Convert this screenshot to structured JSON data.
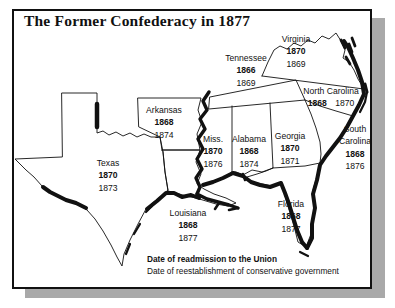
{
  "title": "The Former Confederacy in 1877",
  "legend": {
    "readmission_label": "Date of readmission to the Union",
    "conservative_label": "Date of reestablishment of conservative government"
  },
  "colors": {
    "ink": "#111111",
    "shadow": "#a9a9a9",
    "background": "#ffffff"
  },
  "states": [
    {
      "name": "Virginia",
      "readmission": "1870",
      "conservative": "1869"
    },
    {
      "name": "Tennessee",
      "readmission": "1866",
      "conservative": "1869"
    },
    {
      "name": "North Carolina",
      "readmission": "1868",
      "conservative": "1870"
    },
    {
      "name": "Arkansas",
      "readmission": "1868",
      "conservative": "1874"
    },
    {
      "name": "Miss.",
      "readmission": "1870",
      "conservative": "1876"
    },
    {
      "name": "Alabama",
      "readmission": "1868",
      "conservative": "1874"
    },
    {
      "name": "Georgia",
      "readmission": "1870",
      "conservative": "1871"
    },
    {
      "name": "South Carolina",
      "readmission": "1868",
      "conservative": "1876"
    },
    {
      "name": "Texas",
      "readmission": "1870",
      "conservative": "1873"
    },
    {
      "name": "Louisiana",
      "readmission": "1868",
      "conservative": "1877"
    },
    {
      "name": "Florida",
      "readmission": "1868",
      "conservative": "1877"
    }
  ]
}
